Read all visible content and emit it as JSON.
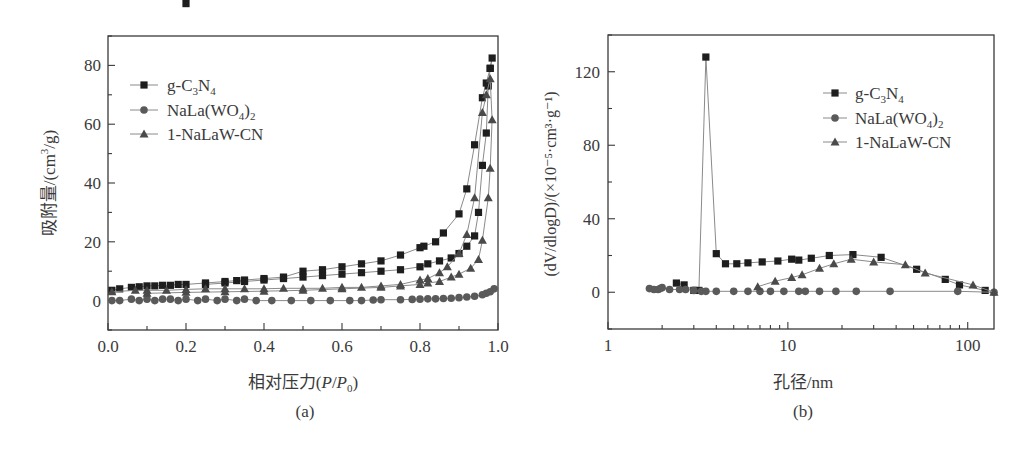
{
  "chart_data": [
    {
      "panel": "(a)",
      "type": "line",
      "title": "",
      "xlabel": "相对压力(P/P0)",
      "ylabel": "吸附量/(cm³/g)",
      "xlim": [
        0.0,
        1.0
      ],
      "ylim": [
        -10,
        90
      ],
      "xticks": [
        "0.0",
        "0.2",
        "0.4",
        "0.6",
        "0.8",
        "1.0"
      ],
      "yticks": [
        "0",
        "20",
        "40",
        "60",
        "80"
      ],
      "grid": false,
      "legend_position": "upper left",
      "series": [
        {
          "name": "g-C3N4",
          "marker": "square",
          "x": [
            0.01,
            0.03,
            0.06,
            0.08,
            0.1,
            0.12,
            0.14,
            0.16,
            0.18,
            0.2,
            0.25,
            0.3,
            0.33,
            0.35,
            0.4,
            0.45,
            0.5,
            0.55,
            0.6,
            0.65,
            0.7,
            0.75,
            0.8,
            0.81,
            0.84,
            0.86,
            0.9,
            0.92,
            0.94,
            0.96,
            0.97,
            0.98,
            0.985,
            0.98,
            0.975,
            0.97,
            0.96,
            0.95,
            0.94,
            0.92,
            0.9,
            0.88,
            0.85,
            0.82,
            0.8,
            0.75,
            0.7,
            0.65,
            0.6,
            0.55,
            0.5,
            0.45,
            0.4,
            0.35,
            0.3,
            0.25,
            0.2
          ],
          "y": [
            3.5,
            4,
            4.5,
            4.7,
            5,
            5,
            5.2,
            5.2,
            5.5,
            5.5,
            6,
            6.5,
            6.8,
            7,
            7.5,
            8,
            10,
            10.5,
            11.5,
            12.5,
            13.5,
            15.5,
            18,
            18.5,
            20,
            23,
            29.5,
            38,
            53,
            69,
            74,
            79,
            82.5,
            79,
            73,
            57,
            46,
            30,
            22,
            18.5,
            16,
            14.5,
            13.5,
            12.5,
            11.5,
            10.5,
            10,
            9.5,
            9,
            8.5,
            8,
            7.5,
            7,
            6.5,
            6,
            5.5
          ]
        },
        {
          "name": "NaLa(WO4)2",
          "marker": "circle",
          "x": [
            0.01,
            0.03,
            0.06,
            0.08,
            0.1,
            0.12,
            0.14,
            0.16,
            0.18,
            0.2,
            0.23,
            0.25,
            0.28,
            0.3,
            0.33,
            0.35,
            0.38,
            0.42,
            0.47,
            0.52,
            0.57,
            0.62,
            0.65,
            0.68,
            0.7,
            0.75,
            0.78,
            0.8,
            0.82,
            0.84,
            0.86,
            0.88,
            0.9,
            0.92,
            0.94,
            0.96,
            0.97,
            0.98,
            0.99
          ],
          "y": [
            0,
            0,
            0.5,
            0,
            0.5,
            0,
            0.5,
            0.5,
            0,
            0.5,
            0,
            0.5,
            0,
            0.5,
            0,
            0.5,
            0,
            0,
            0,
            0,
            0,
            0,
            0,
            0.2,
            0.3,
            0.3,
            0.4,
            0.5,
            0.6,
            0.6,
            0.7,
            0.8,
            1,
            1.2,
            1.5,
            2,
            2.5,
            3,
            4
          ]
        },
        {
          "name": "1-NaLaW-CN",
          "marker": "triangle",
          "x": [
            0.01,
            0.07,
            0.1,
            0.15,
            0.2,
            0.25,
            0.3,
            0.35,
            0.4,
            0.45,
            0.5,
            0.55,
            0.6,
            0.65,
            0.7,
            0.75,
            0.8,
            0.82,
            0.85,
            0.87,
            0.9,
            0.92,
            0.94,
            0.96,
            0.97,
            0.98,
            0.985,
            0.98,
            0.975,
            0.96,
            0.95,
            0.93,
            0.9,
            0.88,
            0.85,
            0.82,
            0.8,
            0.75,
            0.7,
            0.6,
            0.5,
            0.4,
            0.3,
            0.2,
            0.1
          ],
          "y": [
            3,
            3.5,
            3.5,
            3.5,
            3.8,
            4,
            4,
            4,
            4,
            4.2,
            4.2,
            4.2,
            4.5,
            4.5,
            5,
            5.5,
            7,
            7.5,
            9.5,
            11.5,
            16,
            22.5,
            35,
            64,
            70,
            75.5,
            61.5,
            45,
            35,
            20.5,
            14,
            11,
            9,
            8,
            6.5,
            6,
            5.5,
            5,
            4.5,
            4,
            3.5,
            3.2,
            3,
            2.8,
            2.5
          ]
        }
      ]
    },
    {
      "panel": "(b)",
      "type": "line",
      "title": "",
      "xlabel": "孔径/nm",
      "ylabel": "(dV/dlogD)/(×10⁻⁵·cm³·g⁻¹)",
      "xscale": "log",
      "xlim": [
        1,
        140
      ],
      "ylim": [
        -20,
        140
      ],
      "xticks": [
        "1",
        "10",
        "100"
      ],
      "yticks": [
        "0",
        "40",
        "80",
        "120"
      ],
      "grid": false,
      "legend_position": "upper right",
      "series": [
        {
          "name": "g-C3N4",
          "marker": "square",
          "x": [
            2.4,
            2.65,
            3.0,
            3.2,
            3.5,
            4.0,
            4.5,
            5.2,
            6.0,
            7.2,
            8.8,
            10.5,
            11.5,
            13.5,
            17,
            23,
            33,
            52,
            75,
            90,
            125
          ],
          "y": [
            5,
            4,
            1,
            1,
            128,
            21,
            15.5,
            15.5,
            16,
            16.5,
            17,
            18,
            17.5,
            18.5,
            20,
            20.5,
            19,
            12.5,
            7,
            4,
            1
          ]
        },
        {
          "name": "NaLa(WO4)2",
          "marker": "circle",
          "x": [
            1.7,
            1.8,
            1.9,
            1.95,
            2.0,
            2.2,
            2.5,
            2.7,
            3.0,
            3.3,
            3.5,
            4.0,
            5.0,
            6.0,
            7.0,
            8.0,
            9.5,
            11.5,
            12.5,
            15,
            18.5,
            24,
            37,
            88,
            140
          ],
          "y": [
            2,
            1.5,
            1.5,
            2,
            2.5,
            1.5,
            1.5,
            1.5,
            1,
            0.5,
            0.5,
            0.5,
            0.5,
            0.5,
            0.5,
            0.5,
            0.5,
            0.5,
            0.5,
            0.5,
            0.5,
            0.5,
            0.5,
            0.5,
            0
          ]
        },
        {
          "name": "1-NaLaW-CN",
          "marker": "triangle",
          "x": [
            6.8,
            8.5,
            10.5,
            12,
            15,
            18,
            22.5,
            30,
            45,
            58,
            107,
            140
          ],
          "y": [
            3,
            6,
            8,
            9.5,
            13,
            15.5,
            18,
            16.5,
            15,
            10.5,
            4,
            0
          ]
        }
      ]
    }
  ],
  "figure": {
    "panel_a": {
      "axis_xlabel_main": "相对压力(",
      "axis_xlabel_P": "P",
      "axis_xlabel_slash": "/",
      "axis_xlabel_P0": "P",
      "axis_xlabel_sub": "0",
      "axis_xlabel_end": ")",
      "axis_ylabel": "吸附量/(cm",
      "axis_ylabel_sup": "3",
      "axis_ylabel_end": "/g)",
      "caption": "(a)",
      "legend": [
        {
          "main": "g-C",
          "sub1": "3",
          "mid": "N",
          "sub2": "4",
          "end": ""
        },
        {
          "main": "NaLa(WO",
          "sub1": "4",
          "mid": ")",
          "sub2": "2",
          "end": ""
        },
        {
          "main": "1-NaLaW-CN",
          "sub1": "",
          "mid": "",
          "sub2": "",
          "end": ""
        }
      ]
    },
    "panel_b": {
      "axis_xlabel": "孔径/nm",
      "axis_ylabel": "(dV/dlogD)/(×10⁻⁵·cm³·g⁻¹)",
      "caption": "(b)",
      "legend": [
        {
          "main": "g-C",
          "sub1": "3",
          "mid": "N",
          "sub2": "4",
          "end": ""
        },
        {
          "main": "NaLa(WO",
          "sub1": "4",
          "mid": ")",
          "sub2": "2",
          "end": ""
        },
        {
          "main": "1-NaLaW-CN",
          "sub1": "",
          "mid": "",
          "sub2": "",
          "end": ""
        }
      ]
    },
    "colors": {
      "axis": "#3a3a3a",
      "line": "#8a8a8a",
      "marker_square": "#1e1e1e",
      "marker_circle": "#5a5a5a",
      "marker_triangle": "#4a4a4a"
    }
  }
}
